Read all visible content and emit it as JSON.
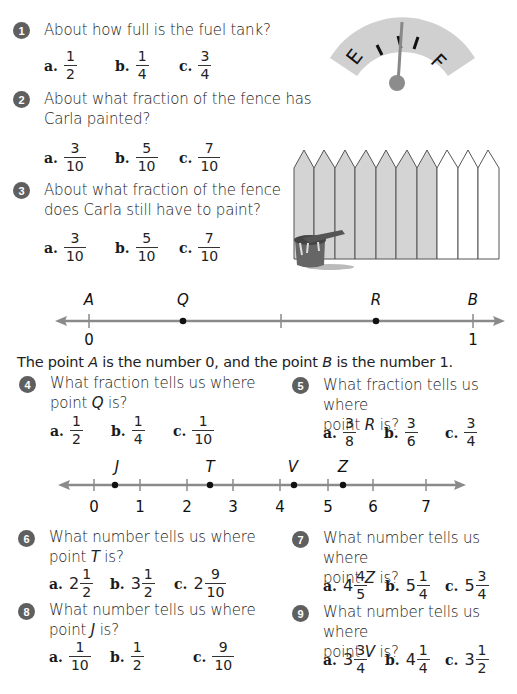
{
  "questions": [
    {
      "number": "1",
      "text": "About how full is the fuel tank?",
      "options": [
        {
          "letter": "a.",
          "whole": "",
          "num": "1",
          "den": "2"
        },
        {
          "letter": "b.",
          "whole": "",
          "num": "1",
          "den": "4"
        },
        {
          "letter": "c.",
          "whole": "",
          "num": "3",
          "den": "4"
        }
      ]
    },
    {
      "number": "2",
      "text_line1": "About what fraction of the fence has",
      "text_line2": "Carla painted?",
      "options": [
        {
          "letter": "a.",
          "whole": "",
          "num": "3",
          "den": "10"
        },
        {
          "letter": "b.",
          "whole": "",
          "num": "5",
          "den": "10"
        },
        {
          "letter": "c.",
          "whole": "",
          "num": "7",
          "den": "10"
        }
      ]
    },
    {
      "number": "3",
      "text_line1": "About what fraction of the fence",
      "text_line2": "does Carla still have to paint?",
      "options": [
        {
          "letter": "a.",
          "whole": "",
          "num": "3",
          "den": "10"
        },
        {
          "letter": "b.",
          "whole": "",
          "num": "5",
          "den": "10"
        },
        {
          "letter": "c.",
          "whole": "",
          "num": "7",
          "den": "10"
        }
      ]
    },
    {
      "number": "4",
      "text_line1": "What fraction tells us where",
      "text_line2_pre": "point ",
      "point": "Q",
      "text_line2_post": " is?",
      "options": [
        {
          "letter": "a.",
          "whole": "",
          "num": "1",
          "den": "2"
        },
        {
          "letter": "b.",
          "whole": "",
          "num": "1",
          "den": "4"
        },
        {
          "letter": "c.",
          "whole": "",
          "num": "1",
          "den": "10"
        }
      ]
    },
    {
      "number": "5",
      "text_line1": "What fraction tells us where",
      "text_line2_pre": "point ",
      "point": "R",
      "text_line2_post": " is?",
      "options": [
        {
          "letter": "a.",
          "whole": "",
          "num": "3",
          "den": "8"
        },
        {
          "letter": "b.",
          "whole": "",
          "num": "3",
          "den": "6"
        },
        {
          "letter": "c.",
          "whole": "",
          "num": "3",
          "den": "4"
        }
      ]
    },
    {
      "number": "6",
      "text_line1": "What number tells us where",
      "text_line2_pre": "point ",
      "point": "T",
      "text_line2_post": " is?",
      "options": [
        {
          "letter": "a.",
          "whole": "2",
          "num": "1",
          "den": "2"
        },
        {
          "letter": "b.",
          "whole": "3",
          "num": "1",
          "den": "2"
        },
        {
          "letter": "c.",
          "whole": "2",
          "num": "9",
          "den": "10"
        }
      ]
    },
    {
      "number": "7",
      "text_line1": "What number tells us where",
      "text_line2_pre": "point ",
      "point": "Z",
      "text_line2_post": " is?",
      "options": [
        {
          "letter": "a.",
          "whole": "4",
          "num": "4",
          "den": "5"
        },
        {
          "letter": "b.",
          "whole": "5",
          "num": "1",
          "den": "4"
        },
        {
          "letter": "c.",
          "whole": "5",
          "num": "3",
          "den": "4"
        }
      ]
    },
    {
      "number": "8",
      "text_line1": "What number tells us where",
      "text_line2_pre": "point ",
      "point": "J",
      "text_line2_post": " is?",
      "options": [
        {
          "letter": "a.",
          "whole": "",
          "num": "1",
          "den": "10"
        },
        {
          "letter": "b.",
          "whole": "",
          "num": "1",
          "den": "2"
        },
        {
          "letter": "c.",
          "whole": "",
          "num": "9",
          "den": "10"
        }
      ]
    },
    {
      "number": "9",
      "text_line1": "What number tells us where",
      "text_line2_pre": "point ",
      "point": "V",
      "text_line2_post": " is?",
      "options": [
        {
          "letter": "a.",
          "whole": "3",
          "num": "3",
          "den": "4"
        },
        {
          "letter": "b.",
          "whole": "4",
          "num": "1",
          "den": "4"
        },
        {
          "letter": "c.",
          "whole": "3",
          "num": "1",
          "den": "2"
        }
      ]
    }
  ],
  "gauge": {
    "empty_label": "E",
    "full_label": "F"
  },
  "numberline1": {
    "points": [
      {
        "label": "A",
        "value": 0
      },
      {
        "label": "Q",
        "value": 0.25
      },
      {
        "label": "R",
        "value": 0.75
      },
      {
        "label": "B",
        "value": 1
      }
    ],
    "tick_labels": [
      "0",
      "1"
    ]
  },
  "sentence": {
    "pre": "The point ",
    "a": "A",
    "mid": " is the number 0, and the point ",
    "b": "B",
    "post": " is the number 1."
  },
  "numberline2": {
    "tick_labels": [
      "0",
      "1",
      "2",
      "3",
      "4",
      "5",
      "6",
      "7"
    ],
    "points": [
      {
        "label": "J",
        "value": 0.5
      },
      {
        "label": "T",
        "value": 2.5
      },
      {
        "label": "V",
        "value": 4.25
      },
      {
        "label": "Z",
        "value": 5.25
      }
    ]
  },
  "colors": {
    "badge": "#5f5f5f",
    "line": "#8a8a8a",
    "painted": "#d4d4d4",
    "gauge": "#d0d0d0"
  }
}
